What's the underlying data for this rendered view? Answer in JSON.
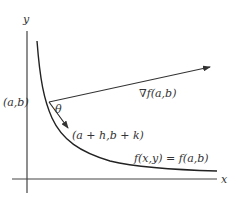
{
  "diagram": {
    "axes": {
      "x_label": "x",
      "y_label": "y"
    },
    "point_label": "(a,b)",
    "angle_label": "θ",
    "gradient_label": "∇f(a,b)",
    "secant_label": "(a + h,b + k)",
    "curve_label": "f(x,y) = f(a,b)",
    "colors": {
      "line": "#333333",
      "background": "#ffffff"
    }
  }
}
